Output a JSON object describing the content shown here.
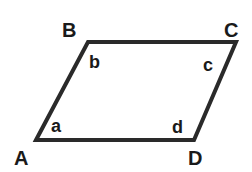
{
  "diagram": {
    "type": "parallelogram",
    "stroke_color": "#2a2a2a",
    "vertices": [
      {
        "id": "A",
        "label": "A",
        "x": 36,
        "y": 140
      },
      {
        "id": "B",
        "label": "B",
        "x": 88,
        "y": 42
      },
      {
        "id": "C",
        "label": "C",
        "x": 236,
        "y": 42
      },
      {
        "id": "D",
        "label": "D",
        "x": 194,
        "y": 140
      }
    ],
    "angles": [
      {
        "vertex": "A",
        "label": "a"
      },
      {
        "vertex": "B",
        "label": "b"
      },
      {
        "vertex": "C",
        "label": "c"
      },
      {
        "vertex": "D",
        "label": "d"
      }
    ]
  }
}
